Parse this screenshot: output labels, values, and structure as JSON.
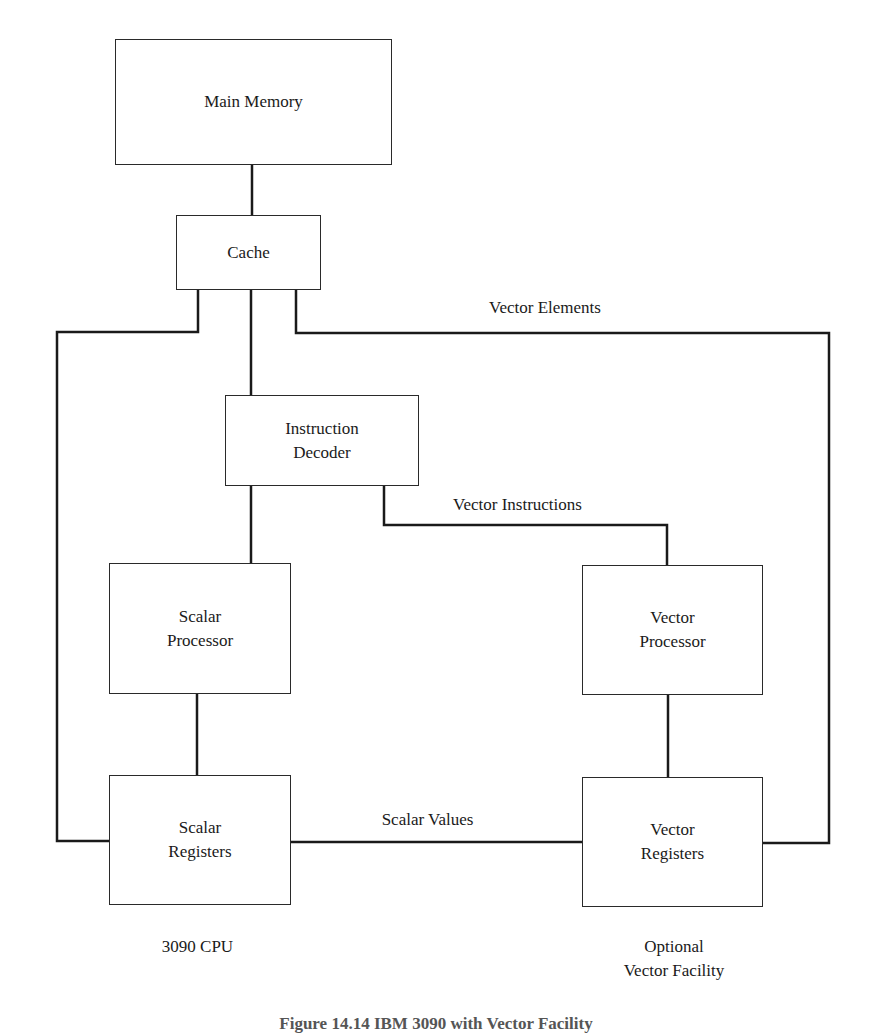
{
  "diagram": {
    "boxes": {
      "main_memory": "Main Memory",
      "cache": "Cache",
      "instruction_decoder": "Instruction\nDecoder",
      "scalar_processor": "Scalar\nProcessor",
      "vector_processor": "Vector\nProcessor",
      "scalar_registers": "Scalar\nRegisters",
      "vector_registers": "Vector\nRegisters"
    },
    "edge_labels": {
      "vector_elements": "Vector Elements",
      "vector_instructions": "Vector Instructions",
      "scalar_values": "Scalar Values"
    },
    "group_labels": {
      "cpu": "3090 CPU",
      "vector_facility": "Optional\nVector Facility"
    },
    "caption": "Figure 14.14 IBM 3090 with Vector Facility",
    "line_color": "#1a1a1a"
  }
}
